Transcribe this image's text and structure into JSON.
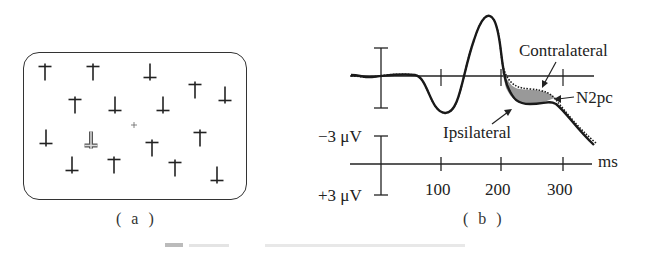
{
  "figure": {
    "panel_a": {
      "label": "( a )",
      "description": "visual search display: T-shaped distractors with one highlighted target among them and a central fixation cross",
      "items": [
        {
          "x": 45,
          "y": 72,
          "orient": "up"
        },
        {
          "x": 93,
          "y": 72,
          "orient": "up"
        },
        {
          "x": 150,
          "y": 72,
          "orient": "down"
        },
        {
          "x": 195,
          "y": 90,
          "orient": "up"
        },
        {
          "x": 225,
          "y": 95,
          "orient": "down"
        },
        {
          "x": 75,
          "y": 105,
          "orient": "up"
        },
        {
          "x": 115,
          "y": 105,
          "orient": "down"
        },
        {
          "x": 163,
          "y": 105,
          "orient": "down"
        },
        {
          "x": 46,
          "y": 138,
          "orient": "down"
        },
        {
          "x": 91,
          "y": 140,
          "orient": "down",
          "target": true
        },
        {
          "x": 152,
          "y": 148,
          "orient": "up"
        },
        {
          "x": 200,
          "y": 138,
          "orient": "up"
        },
        {
          "x": 72,
          "y": 165,
          "orient": "down"
        },
        {
          "x": 114,
          "y": 165,
          "orient": "up"
        },
        {
          "x": 175,
          "y": 168,
          "orient": "up"
        },
        {
          "x": 217,
          "y": 175,
          "orient": "down"
        }
      ],
      "fixation": {
        "x": 134,
        "y": 125
      }
    },
    "panel_b": {
      "label": "( b )",
      "annotations": {
        "contralateral": "Contralateral",
        "n2pc": "N2pc",
        "ipsilateral": "Ipsilateral"
      },
      "axis": {
        "neg_label": "−3 μV",
        "pos_label": "+3 μV",
        "unit": "ms",
        "ticks": [
          "100",
          "200",
          "300"
        ]
      }
    },
    "caption": "图 ... N2pc 示意 (illegible)"
  },
  "chart_data": {
    "type": "line",
    "title": "",
    "xlabel": "ms",
    "ylabel": "μV (negative up)",
    "x_ticks": [
      100,
      200,
      300
    ],
    "y_scale": [
      "-3 μV",
      "+3 μV"
    ],
    "xlim": [
      -50,
      350
    ],
    "series": [
      {
        "name": "Contralateral",
        "style": "dotted",
        "x": [
          -50,
          0,
          50,
          100,
          140,
          170,
          200,
          230,
          260,
          280,
          310,
          340
        ],
        "y": [
          0,
          0,
          0,
          2.8,
          0,
          -3.2,
          0,
          1.1,
          1.3,
          2.0,
          3.2,
          4.3
        ]
      },
      {
        "name": "Ipsilateral",
        "style": "solid",
        "x": [
          -50,
          0,
          50,
          100,
          140,
          170,
          200,
          230,
          260,
          280,
          310,
          340
        ],
        "y": [
          0,
          0,
          0,
          2.8,
          0,
          -3.2,
          0.2,
          2.4,
          2.6,
          2.4,
          3.3,
          4.4
        ]
      }
    ],
    "annotations": [
      "N2pc (shaded difference ~200-280 ms)"
    ],
    "note": "negative voltage plotted upward; shaded region between curves marks N2pc"
  }
}
